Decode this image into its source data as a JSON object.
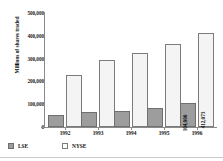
{
  "chart_data": {
    "type": "bar",
    "title": "",
    "xlabel": "",
    "ylabel": "Millions of shares traded",
    "categories": [
      "1992",
      "1993",
      "1994",
      "1995",
      "1996"
    ],
    "ylim": [
      0,
      500000
    ],
    "yticks": [
      0,
      100000,
      200000,
      300000,
      400000,
      500000
    ],
    "ytick_labels": [
      "0",
      "100,000",
      "200,000",
      "300,000",
      "400,000",
      "500,000"
    ],
    "grid": false,
    "legend_position": "bottom-left",
    "series": [
      {
        "name": "LSE",
        "color": "#9d9d9d",
        "values": [
          52000,
          65000,
          72000,
          85000,
          104000
        ],
        "labels": [
          "",
          "",
          "",
          "",
          "104,000"
        ]
      },
      {
        "name": "NYSE",
        "color": "#f4f4f4",
        "values": [
          229000,
          295000,
          325000,
          362000,
          412073
        ],
        "labels": [
          "",
          "",
          "",
          "",
          "412,073"
        ]
      }
    ]
  },
  "legend": {
    "items": [
      {
        "label": "LSE",
        "swatch": "lse"
      },
      {
        "label": "NYSE",
        "swatch": "nyse"
      }
    ]
  }
}
